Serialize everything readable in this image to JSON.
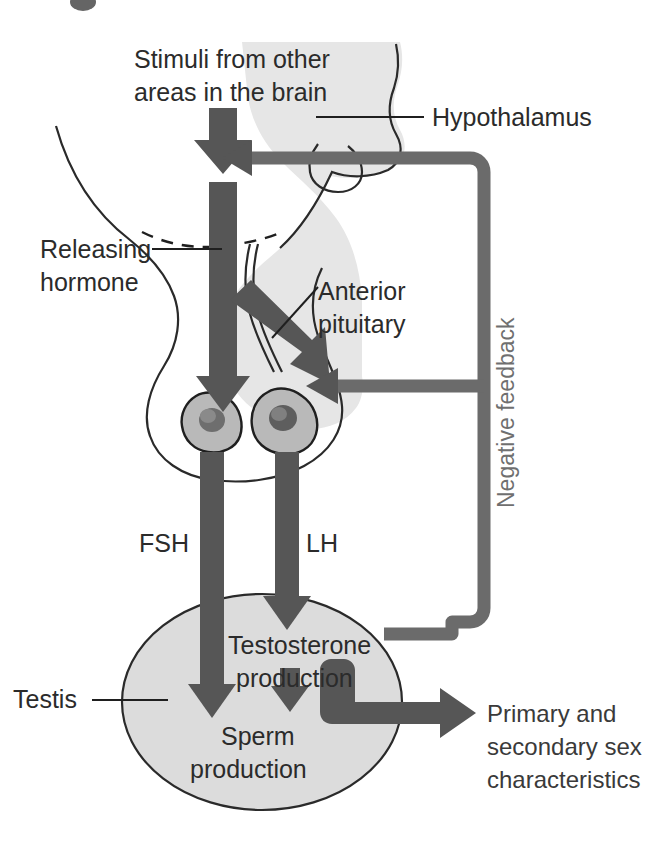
{
  "figure": {
    "type": "biological-flow-diagram"
  },
  "colors": {
    "arrow": "#565656",
    "feedback_line": "#6b6b6b",
    "organ_fill": "#dcdcdc",
    "brain_fill": "#e4e4e4",
    "cell_fill": "#b8b8b8",
    "nucleus_fill": "#6a6a6a",
    "text": "#2b2b2b",
    "feedback_text": "#6f6f6f",
    "outline": "#2a2a2a",
    "page_background": "#ffffff"
  },
  "labels": {
    "stimuli_line1": "Stimuli from other",
    "stimuli_line2": "areas in the brain",
    "hypothalamus": "Hypothalamus",
    "releasing_line1": "Releasing",
    "releasing_line2": "hormone",
    "anterior_line1": "Anterior",
    "anterior_line2": "pituitary",
    "negative_feedback": "Negative feedback",
    "fsh": "FSH",
    "lh": "LH",
    "testis": "Testis",
    "testosterone_line1": "Testosterone",
    "testosterone_line2": "production",
    "sperm_line1": "Sperm",
    "sperm_line2": "production",
    "characteristics_line1": "Primary and",
    "characteristics_line2": "secondary sex",
    "characteristics_line3": "characteristics"
  },
  "flow": {
    "nodes": [
      {
        "id": "stimuli",
        "label": "Stimuli from other areas in the brain"
      },
      {
        "id": "hypothalamus",
        "label": "Hypothalamus"
      },
      {
        "id": "releasing-hormone",
        "label": "Releasing hormone"
      },
      {
        "id": "anterior-pituitary",
        "label": "Anterior pituitary"
      },
      {
        "id": "testis",
        "label": "Testis"
      },
      {
        "id": "testosterone",
        "label": "Testosterone production"
      },
      {
        "id": "sperm",
        "label": "Sperm production"
      },
      {
        "id": "sex-characteristics",
        "label": "Primary and secondary sex characteristics"
      }
    ],
    "edges": [
      {
        "from": "stimuli",
        "to": "hypothalamus",
        "label": ""
      },
      {
        "from": "hypothalamus",
        "to": "anterior-pituitary",
        "label": "Releasing hormone"
      },
      {
        "from": "anterior-pituitary",
        "to": "sperm",
        "label": "FSH"
      },
      {
        "from": "anterior-pituitary",
        "to": "testosterone",
        "label": "LH"
      },
      {
        "from": "testosterone",
        "to": "sperm",
        "label": ""
      },
      {
        "from": "testosterone",
        "to": "sex-characteristics",
        "label": ""
      },
      {
        "from": "testosterone",
        "to": "hypothalamus",
        "label": "Negative feedback"
      },
      {
        "from": "testosterone",
        "to": "anterior-pituitary",
        "label": "Negative feedback"
      }
    ]
  }
}
